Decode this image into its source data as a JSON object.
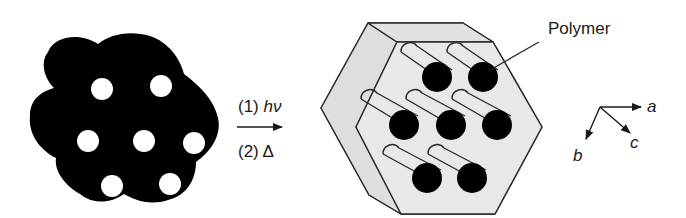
{
  "diagram": {
    "left_particle": {
      "description": "black aggregate blob with white pores",
      "fill": "#000000",
      "pore_color": "#ffffff",
      "pore_count": 7
    },
    "reaction_arrow": {
      "step1_prefix": "(1)",
      "step1_symbol": "hν",
      "step2_prefix": "(2)",
      "step2_symbol": "Δ"
    },
    "hexagonal_crystal": {
      "face_color": "#e6e6e6",
      "edge_color": "#2a2a2a",
      "channel_end_color": "#000000",
      "channel_count": 7
    },
    "callout_label": "Polymer",
    "axes": {
      "a": "a",
      "b": "b",
      "c": "c"
    }
  }
}
